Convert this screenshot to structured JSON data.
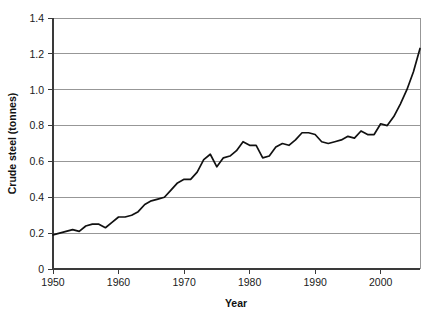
{
  "chart_data": {
    "type": "line",
    "title": "",
    "xlabel": "Year",
    "ylabel": "Crude steel (tonnes)",
    "xlim": [
      1950,
      2006
    ],
    "ylim": [
      0,
      1.4
    ],
    "grid": true,
    "legend": false,
    "legend_position": "none",
    "x_ticks": [
      1950,
      1960,
      1970,
      1980,
      1990,
      2000
    ],
    "x_tick_labels": [
      "1950",
      "1960",
      "1970",
      "1980",
      "1990",
      "2000"
    ],
    "y_ticks": [
      0,
      0.2,
      0.4,
      0.6,
      0.8,
      1.0,
      1.2,
      1.4
    ],
    "y_tick_labels": [
      "0",
      "0.2",
      "0.4",
      "0.6",
      "0.8",
      "1.0",
      "1.2",
      "1.4"
    ],
    "line_color": "#111111",
    "grid_color": "#8c8c8c",
    "series": [
      {
        "name": "Crude steel per capita",
        "x": [
          1950,
          1951,
          1952,
          1953,
          1954,
          1955,
          1956,
          1957,
          1958,
          1959,
          1960,
          1961,
          1962,
          1963,
          1964,
          1965,
          1966,
          1967,
          1968,
          1969,
          1970,
          1971,
          1972,
          1973,
          1974,
          1975,
          1976,
          1977,
          1978,
          1979,
          1980,
          1981,
          1982,
          1983,
          1984,
          1985,
          1986,
          1987,
          1988,
          1989,
          1990,
          1991,
          1992,
          1993,
          1994,
          1995,
          1996,
          1997,
          1998,
          1999,
          2000,
          2001,
          2002,
          2003,
          2004,
          2005,
          2006
        ],
        "values": [
          0.19,
          0.2,
          0.21,
          0.22,
          0.21,
          0.24,
          0.25,
          0.25,
          0.23,
          0.26,
          0.29,
          0.29,
          0.3,
          0.32,
          0.36,
          0.38,
          0.39,
          0.4,
          0.44,
          0.48,
          0.5,
          0.5,
          0.54,
          0.61,
          0.64,
          0.57,
          0.62,
          0.63,
          0.66,
          0.71,
          0.69,
          0.69,
          0.62,
          0.63,
          0.68,
          0.7,
          0.69,
          0.72,
          0.76,
          0.76,
          0.75,
          0.71,
          0.7,
          0.71,
          0.72,
          0.74,
          0.73,
          0.77,
          0.75,
          0.75,
          0.81,
          0.8,
          0.85,
          0.92,
          1.0,
          1.1,
          1.23
        ]
      }
    ]
  },
  "axes": {
    "y_axis_title": "Crude steel (tonnes)",
    "x_axis_title": "Year"
  }
}
